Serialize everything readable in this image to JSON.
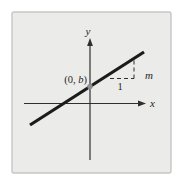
{
  "figure": {
    "labels": {
      "y_axis": "y",
      "x_axis": "x",
      "intercept_prefix": "(0, ",
      "intercept_var": "b",
      "intercept_suffix": ")",
      "run": "1",
      "slope": "m"
    },
    "colors": {
      "page_bg": "#ffffff",
      "panel_fill": "#ebebe9",
      "panel_border": "#c6c6c4",
      "axis": "#2f2f2f",
      "line": "#1b1b1b",
      "dash": "#2f2f2f",
      "point": "#8f8f8f",
      "text": "#1f1f1f"
    }
  }
}
